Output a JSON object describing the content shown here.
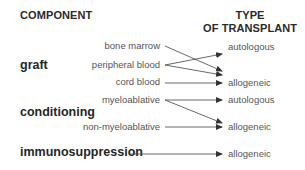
{
  "headers": {
    "component": "COMPONENT",
    "type_line1": "TYPE",
    "type_line2": "OF TRANSPLANT"
  },
  "categories": {
    "graft": "graft",
    "conditioning": "conditioning",
    "immunosuppression": "immunosuppression"
  },
  "sources": {
    "bone_marrow": "bone marrow",
    "peripheral_blood": "peripheral blood",
    "cord_blood": "cord blood",
    "myeloablative": "myeloablative",
    "non_myeloablative": "non-myeloablative"
  },
  "targets": {
    "graft_autologous": "autologous",
    "graft_allogeneic": "allogeneic",
    "conditioning_autologous": "autologous",
    "conditioning_allogeneic": "allogeneic",
    "immuno_allogeneic": "allogeneic"
  },
  "connections": [
    {
      "from": "bone marrow",
      "to": "allogeneic"
    },
    {
      "from": "peripheral blood",
      "to": "autologous"
    },
    {
      "from": "peripheral blood",
      "to": "allogeneic"
    },
    {
      "from": "cord blood",
      "to": "allogeneic"
    },
    {
      "from": "myeloablative",
      "to": "autologous"
    },
    {
      "from": "myeloablative",
      "to": "allogeneic"
    },
    {
      "from": "non-myeloablative",
      "to": "allogeneic"
    },
    {
      "from": "immunosuppression",
      "to": "allogeneic"
    }
  ],
  "colors": {
    "line": "#444444",
    "text_dark": "#262626",
    "text_light": "#555555"
  }
}
